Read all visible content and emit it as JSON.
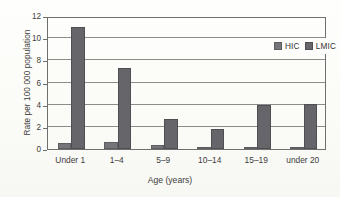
{
  "chart_data": {
    "type": "bar",
    "title": "",
    "subtitle": "",
    "xlabel": "Age (years)",
    "ylabel": "Rate per 100 000 population",
    "categories": [
      "Under 1",
      "1–4",
      "5–9",
      "10–14",
      "15–19",
      "under 20"
    ],
    "series": [
      {
        "name": "HIC",
        "values": [
          0.55,
          0.6,
          0.4,
          0.15,
          0.1,
          0.2
        ],
        "color": "#76767a"
      },
      {
        "name": "LMIC",
        "values": [
          11.0,
          7.3,
          2.7,
          1.8,
          4.0,
          4.1
        ],
        "color": "#65656a"
      }
    ],
    "ylim": [
      0,
      12
    ],
    "ytick_values": [
      0,
      2,
      4,
      6,
      8,
      10,
      12
    ],
    "ytick_labels": [
      "0",
      "2",
      "4",
      "6",
      "8",
      "10",
      "12"
    ],
    "grid": "horizontal",
    "legend_position": "top-right-inside",
    "legend_entries": [
      "HIC",
      "LMIC"
    ]
  }
}
